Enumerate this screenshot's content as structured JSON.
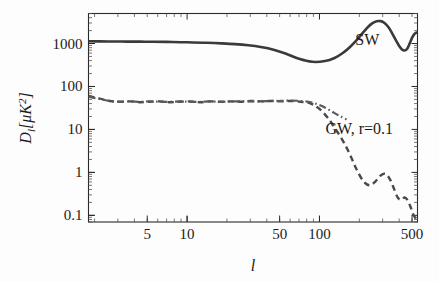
{
  "chart_data": {
    "type": "line",
    "title": "",
    "subtitle": "",
    "xlabel": "l",
    "ylabel": "D_l[μK²]",
    "xscale": "log",
    "yscale": "log",
    "xlim": [
      1.8,
      550
    ],
    "ylim": [
      0.07,
      5000
    ],
    "grid": false,
    "legend": "inline-annotations",
    "xticks": [
      {
        "value": 5,
        "label": "5"
      },
      {
        "value": 10,
        "label": "10"
      },
      {
        "value": 50,
        "label": "50"
      },
      {
        "value": 100,
        "label": "100"
      },
      {
        "value": 500,
        "label": "500"
      }
    ],
    "yticks": [
      {
        "value": 1000,
        "label": "1000"
      },
      {
        "value": 100,
        "label": "100"
      },
      {
        "value": 10,
        "label": "10"
      },
      {
        "value": 1,
        "label": "1"
      },
      {
        "value": 0.1,
        "label": "0.1"
      }
    ],
    "annotations": [
      {
        "text": "SW",
        "x": 230,
        "y": 900,
        "name": "sw-curve-label"
      },
      {
        "text": "GW, r=0.1",
        "x": 200,
        "y": 8,
        "name": "gw-curve-label"
      }
    ],
    "series": [
      {
        "name": "SW",
        "style": "solid",
        "color": "#3a3a3a",
        "x": [
          1.8,
          2.2,
          2.8,
          3.5,
          4.4,
          5.5,
          7,
          9,
          11,
          14,
          18,
          23,
          29,
          36,
          45,
          56,
          70,
          88,
          110,
          130,
          150,
          170,
          190,
          210,
          230,
          250,
          270,
          290,
          310,
          330,
          350,
          380,
          400,
          420,
          440,
          460,
          480,
          500,
          520,
          540
        ],
        "y": [
          1130,
          1120,
          1115,
          1110,
          1105,
          1100,
          1090,
          1075,
          1060,
          1040,
          1010,
          970,
          910,
          830,
          720,
          580,
          440,
          375,
          390,
          460,
          600,
          830,
          1180,
          1700,
          2350,
          2950,
          3300,
          3320,
          3000,
          2450,
          1850,
          1150,
          880,
          730,
          690,
          760,
          1000,
          1350,
          1650,
          1800
        ]
      },
      {
        "name": "GW, r=0.1",
        "style": "dashed",
        "color": "#4a4a4a",
        "x": [
          1.8,
          2.2,
          2.6,
          3.1,
          3.7,
          4.4,
          5.2,
          6.2,
          7.4,
          8.8,
          10.5,
          12.5,
          15,
          18,
          21,
          25,
          30,
          36,
          43,
          51,
          61,
          72,
          86,
          100,
          115,
          130,
          150,
          170,
          190,
          215,
          240,
          265,
          290,
          315,
          340,
          365,
          390,
          415,
          440,
          465,
          490,
          515,
          540
        ],
        "y": [
          60,
          52,
          46,
          44,
          45,
          43,
          44,
          45,
          43,
          44,
          45,
          43,
          45,
          44,
          45,
          44,
          46,
          45,
          46,
          45,
          46,
          44,
          40,
          30,
          19,
          11,
          5.5,
          2.6,
          1.2,
          0.62,
          0.5,
          0.62,
          0.85,
          0.92,
          0.7,
          0.42,
          0.26,
          0.23,
          0.26,
          0.22,
          0.15,
          0.1,
          0.08
        ]
      },
      {
        "name": "GW, r=0.1 (alt)",
        "style": "dashdot",
        "color": "#5a5a5a",
        "x": [
          1.8,
          2.2,
          2.6,
          3.1,
          3.7,
          4.4,
          5.2,
          6.2,
          7.4,
          8.8,
          10.5,
          12.5,
          15,
          18,
          21,
          25,
          30,
          36,
          43,
          51,
          61,
          72,
          86,
          100,
          115,
          130,
          145,
          160
        ],
        "y": [
          58,
          51,
          46,
          44,
          45,
          44,
          45,
          44,
          44,
          45,
          44,
          44,
          45,
          44,
          45,
          45,
          45,
          45,
          46,
          46,
          47,
          46,
          43,
          37,
          30,
          24,
          20,
          17
        ]
      }
    ]
  },
  "figure": {
    "background_color": "#fdfdfd",
    "axis_color": "#2a2a2a"
  }
}
